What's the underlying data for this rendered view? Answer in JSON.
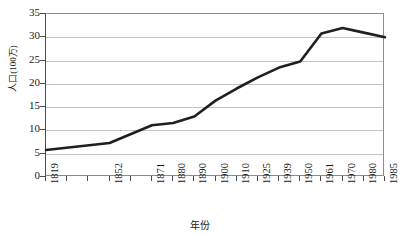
{
  "chart_data": {
    "type": "line",
    "title": "",
    "xlabel": "年份",
    "ylabel": "人口(100万)",
    "categories": [
      "1819",
      "1852",
      "1871",
      "1880",
      "1890",
      "1900",
      "1910",
      "1925",
      "1939",
      "1950",
      "1961",
      "1970",
      "1980",
      "1985"
    ],
    "x": [
      0,
      3,
      5,
      6,
      7,
      8,
      9,
      10,
      11,
      12,
      13,
      14,
      15,
      16
    ],
    "values": [
      5.8,
      7.3,
      11.1,
      11.6,
      13.0,
      16.4,
      19.0,
      21.4,
      23.5,
      24.8,
      30.8,
      32.0,
      31.0,
      30.0
    ],
    "series": [
      {
        "name": "人口",
        "values": [
          5.8,
          7.3,
          11.1,
          11.6,
          13.0,
          16.4,
          19.0,
          21.4,
          23.5,
          24.8,
          30.8,
          32.0,
          31.0,
          30.0
        ]
      }
    ],
    "y_ticks": [
      0,
      5,
      10,
      15,
      20,
      25,
      30,
      35
    ],
    "ylim": [
      0,
      35
    ],
    "xlim": [
      0,
      16
    ],
    "x_tick_count": 17,
    "grid": "horizontal",
    "legend": "none",
    "line_color": "#1f1f1f",
    "grid_color": "#c4c4c4",
    "axis_color": "#4a4a4a",
    "background": "#ffffff"
  },
  "axes": {
    "y_title": "人口(100万)",
    "x_title": "年份",
    "y_tick_labels": [
      "0",
      "5",
      "10",
      "15",
      "20",
      "25",
      "30",
      "35"
    ],
    "x_tick_labels": [
      "1819",
      "1852",
      "1871",
      "1880",
      "1890",
      "1900",
      "1910",
      "1925",
      "1939",
      "1950",
      "1961",
      "1970",
      "1980",
      "1985"
    ]
  }
}
